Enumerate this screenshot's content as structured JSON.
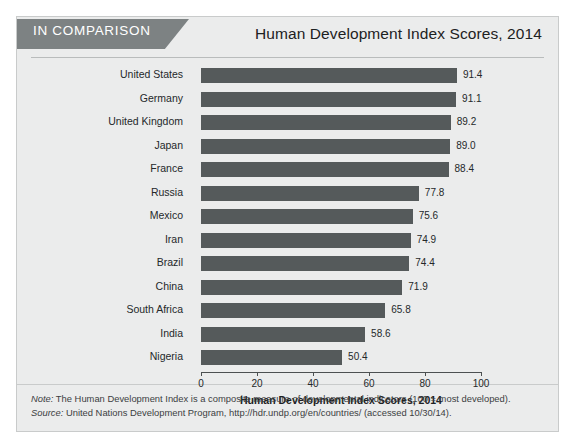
{
  "header": {
    "badge": "IN COMPARISON",
    "title": "Human Development Index Scores, 2014"
  },
  "footnotes": {
    "note_label": "Note:",
    "note_text": " The Human Development Index is a composite measure of developmental indicators (100 = most developed).",
    "source_label": "Source:",
    "source_text": " United Nations Development Program, http://hdr.undp.org/en/countries/ (accessed 10/30/14)."
  },
  "colors": {
    "bar": "#555a5b",
    "badge": "#7d8283",
    "panel": "#ebecec",
    "axis": "#4c5051"
  },
  "chart_data": {
    "type": "bar",
    "orientation": "horizontal",
    "title": "Human Development Index Scores, 2014",
    "xlabel": "Human Development Index Scores, 2014",
    "ylabel": "",
    "xlim": [
      0,
      100
    ],
    "xticks": [
      0,
      20,
      40,
      60,
      80,
      100
    ],
    "grid": false,
    "legend": false,
    "categories": [
      "United States",
      "Germany",
      "United Kingdom",
      "Japan",
      "France",
      "Russia",
      "Mexico",
      "Iran",
      "Brazil",
      "China",
      "South Africa",
      "India",
      "Nigeria"
    ],
    "values": [
      91.4,
      91.1,
      89.2,
      89.0,
      88.4,
      77.8,
      75.6,
      74.9,
      74.4,
      71.9,
      65.8,
      58.6,
      50.4
    ],
    "value_labels": [
      "91.4",
      "91.1",
      "89.2",
      "89.0",
      "88.4",
      "77.8",
      "75.6",
      "74.9",
      "74.4",
      "71.9",
      "65.8",
      "58.6",
      "50.4"
    ]
  }
}
